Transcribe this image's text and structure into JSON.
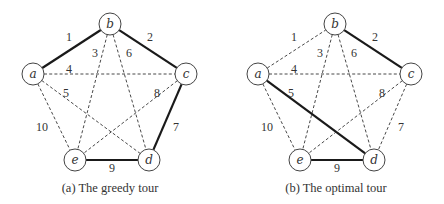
{
  "diagrams": [
    {
      "id": "greedy",
      "caption": "(a) The greedy tour",
      "offset_x": 0,
      "tour_edges": [
        "a-b",
        "b-c",
        "c-d",
        "d-e",
        "e-a"
      ]
    },
    {
      "id": "optimal",
      "caption": "(b) The optimal tour",
      "offset_x": 225,
      "tour_edges": [
        "b-c",
        "c-a",
        "a-d",
        "d-e",
        "e-b"
      ]
    }
  ],
  "nodes": [
    {
      "id": "a",
      "label": "a",
      "x": 33,
      "y": 74
    },
    {
      "id": "b",
      "label": "b",
      "x": 110,
      "y": 24
    },
    {
      "id": "c",
      "label": "c",
      "x": 186,
      "y": 74
    },
    {
      "id": "d",
      "label": "d",
      "x": 149,
      "y": 160
    },
    {
      "id": "e",
      "label": "e",
      "x": 75,
      "y": 160
    }
  ],
  "edges": [
    {
      "id": "a-b",
      "from": "a",
      "to": "b",
      "weight": "1",
      "lx": 69,
      "ly": 41
    },
    {
      "id": "b-c",
      "from": "b",
      "to": "c",
      "weight": "2",
      "lx": 150,
      "ly": 41
    },
    {
      "id": "b-e",
      "from": "b",
      "to": "e",
      "weight": "3",
      "lx": 95,
      "ly": 57
    },
    {
      "id": "a-c",
      "from": "a",
      "to": "c",
      "weight": "4",
      "lx": 69,
      "ly": 73
    },
    {
      "id": "a-d",
      "from": "a",
      "to": "d",
      "weight": "5",
      "lx": 66,
      "ly": 97
    },
    {
      "id": "b-d",
      "from": "b",
      "to": "d",
      "weight": "6",
      "lx": 129,
      "ly": 57
    },
    {
      "id": "c-d",
      "from": "c",
      "to": "d",
      "weight": "7",
      "lx": 176,
      "ly": 131
    },
    {
      "id": "c-e",
      "from": "c",
      "to": "e",
      "weight": "8",
      "lx": 157,
      "ly": 97
    },
    {
      "id": "d-e",
      "from": "d",
      "to": "e",
      "weight": "9",
      "lx": 112,
      "ly": 172
    },
    {
      "id": "a-e",
      "from": "a",
      "to": "e",
      "weight": "10",
      "lx": 42,
      "ly": 131
    }
  ],
  "style": {
    "node_radius": 11,
    "tour_edge_color": "#1a1a1a",
    "non_tour_edge_color": "#333333",
    "caption_y": 192
  }
}
